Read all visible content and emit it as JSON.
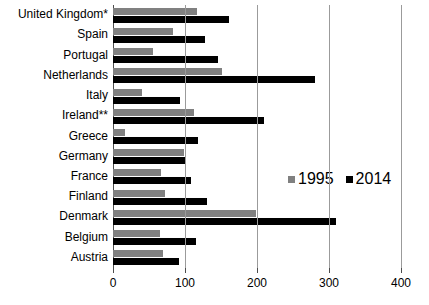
{
  "chart_data": {
    "type": "bar",
    "orientation": "horizontal",
    "title": "",
    "subtitle": "",
    "xlabel": "",
    "ylabel": "",
    "xlim": [
      0,
      400
    ],
    "xticks": [
      0,
      100,
      200,
      300,
      400
    ],
    "xtick_labels": [
      "0",
      "100",
      "200",
      "300",
      "400"
    ],
    "grid": true,
    "grid_axis": "x",
    "legend_position": "middle-right",
    "categories": [
      "United Kingdom*",
      "Spain",
      "Portugal",
      "Netherlands",
      "Italy",
      "Ireland**",
      "Greece",
      "Germany",
      "France",
      "Finland",
      "Denmark",
      "Belgium",
      "Austria"
    ],
    "series": [
      {
        "name": "1995",
        "color": "#808080",
        "values": [
          117,
          84,
          56,
          152,
          40,
          113,
          17,
          99,
          66,
          72,
          199,
          65,
          70
        ]
      },
      {
        "name": "2014",
        "color": "#000000",
        "values": [
          161,
          128,
          146,
          280,
          93,
          210,
          118,
          101,
          109,
          131,
          310,
          115,
          91
        ]
      }
    ]
  },
  "legend": {
    "entries": [
      {
        "label": "1995",
        "color": "#808080"
      },
      {
        "label": "2014",
        "color": "#000000"
      }
    ]
  }
}
